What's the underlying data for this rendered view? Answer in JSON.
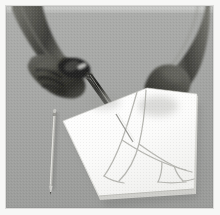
{
  "image": {
    "kind": "photograph",
    "title": "Hands cutting a drawn shape out of white paper with scissors",
    "palette": {
      "frame_margin": "#f7f7f6",
      "background_surface": "#a4a5a3",
      "surface_shadow": "#8e8f8d",
      "paper_white": "#fdfdfc",
      "paper_shadow": "#9a9b99",
      "paper_edge": "#c9c9c6",
      "skin_light": "#8c8c88",
      "skin_mid": "#6a6a66",
      "skin_dark": "#454542",
      "skin_deepest": "#2b2b29",
      "scissors_dark": "#242422",
      "scissors_highlight": "#e8e8e6",
      "pencil_body": "#b8b8b4",
      "pencil_line": "#7d7d79",
      "pencil_drawing_line": "#b3b3ae"
    },
    "subjects": [
      {
        "name": "left-arm",
        "description": "dark-skinned forearm entering from top-left"
      },
      {
        "name": "right-arm",
        "description": "dark-skinned forearm entering from top-right"
      },
      {
        "name": "left-hand",
        "description": "hand gripping the scissors handles"
      },
      {
        "name": "right-hand",
        "description": "hand steadying the sheet of paper"
      },
      {
        "name": "scissors",
        "description": "dark metal scissors cutting along a pencil line"
      },
      {
        "name": "paper-sheet",
        "description": "white sheet of paper laid at an angle on a gray table"
      },
      {
        "name": "drawn-outline",
        "description": "faint pencil-drawn curved fish-like outline on the paper"
      },
      {
        "name": "cut-line",
        "description": "partial cut following the drawn outline"
      },
      {
        "name": "loose-pencil",
        "description": "a pencil resting on the gray surface to the left of the paper"
      },
      {
        "name": "table-surface",
        "description": "flat mid-gray work surface"
      }
    ],
    "caption": ""
  }
}
